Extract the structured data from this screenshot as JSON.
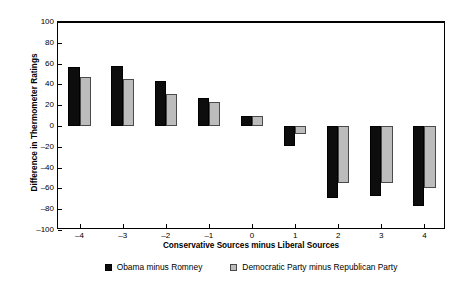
{
  "chart_data": {
    "type": "bar",
    "title": "",
    "xlabel": "Conservative Sources minus Liberal Sources",
    "ylabel": "Difference in Thermometer Ratings",
    "categories": [
      "-4",
      "-3",
      "-2",
      "-1",
      "0",
      "1",
      "2",
      "3",
      "4"
    ],
    "series": [
      {
        "name": "Obama minus Romney",
        "color": "#0d0d0d",
        "values": [
          57,
          58,
          43,
          27,
          10,
          -19,
          -69,
          -67,
          -77
        ]
      },
      {
        "name": "Democratic Party minus Republican Party",
        "color": "#bcbcbc",
        "values": [
          47,
          45,
          31,
          23,
          10,
          -8,
          -55,
          -55,
          -60
        ]
      }
    ],
    "ylim": [
      -100,
      100
    ],
    "yticks": [
      100,
      80,
      60,
      40,
      20,
      0,
      -20,
      -40,
      -60,
      -80,
      -100
    ],
    "ytick_labels": [
      "100",
      "80",
      "60",
      "40",
      "20",
      "0",
      "-20",
      "-40",
      "-60",
      "-80",
      "-100"
    ],
    "xtick_labels": [
      "-4",
      "-3",
      "-2",
      "-1",
      "0",
      "1",
      "2",
      "3",
      "4"
    ],
    "grid": false,
    "legend_position": "bottom",
    "zero_line": 0
  }
}
